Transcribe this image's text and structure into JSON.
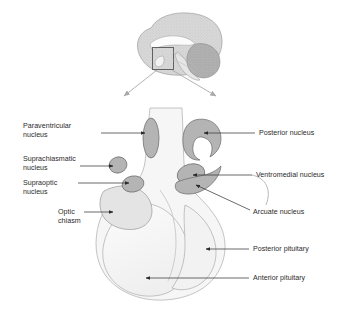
{
  "figure": {
    "background_color": "#ffffff"
  },
  "palette": {
    "nucleus_fill": "#b4b4b4",
    "nucleus_stroke": "#6e6e6e",
    "body_fill": "#f4f4f4",
    "body_stroke": "#9a9a9a",
    "pituitary_fill": "#f7f7f7",
    "chiasm_fill": "#e2e2e2",
    "brain_fill": "#d6d6d6",
    "cerebellum_fill": "#b0b0b0",
    "leader_line": "#3a3a3a",
    "inset_arrow": "#a9a9a9",
    "text": "#2b2b2b"
  },
  "inset": {
    "name": "brain-midsagittal-inset",
    "box_label": "",
    "arrow_count": 2
  },
  "labels": {
    "paraventricular_nucleus": "Paraventricular\nnucleus",
    "suprachiasmatic_nucleus": "Suprachiasmatic\nnucleus",
    "supraoptic_nucleus": "Supraoptic\nnucleus",
    "optic_chiasm": "Optic\nchiasm",
    "posterior_nucleus": "Posterior nucleus",
    "ventromedial_nucleus": "Ventromedial nucleus",
    "arcuate_nucleus": "Arcuate nucleus",
    "posterior_pituitary": "Posterior pituitary",
    "anterior_pituitary": "Anterior pituitary"
  },
  "structures": [
    {
      "id": "paraventricular_nucleus",
      "label": "Paraventricular nucleus",
      "side": "left",
      "shape": "vertical-ellipse"
    },
    {
      "id": "posterior_nucleus",
      "label": "Posterior nucleus",
      "side": "right",
      "shape": "kidney-bean"
    },
    {
      "id": "suprachiasmatic_nucleus",
      "label": "Suprachiasmatic nucleus",
      "side": "left",
      "shape": "small-oval"
    },
    {
      "id": "supraoptic_nucleus",
      "label": "Supraoptic nucleus",
      "side": "left",
      "shape": "small-oval"
    },
    {
      "id": "ventromedial_nucleus",
      "label": "Ventromedial nucleus",
      "side": "right",
      "shape": "oval"
    },
    {
      "id": "arcuate_nucleus",
      "label": "Arcuate nucleus",
      "side": "right",
      "shape": "crescent"
    },
    {
      "id": "optic_chiasm",
      "label": "Optic chiasm",
      "side": "left",
      "shape": "rounded-wedge"
    },
    {
      "id": "anterior_pituitary",
      "label": "Anterior pituitary",
      "side": "right",
      "shape": "large-lobe"
    },
    {
      "id": "posterior_pituitary",
      "label": "Posterior pituitary",
      "side": "right",
      "shape": "small-lobe"
    }
  ]
}
